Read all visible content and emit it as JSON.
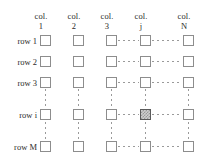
{
  "figure": {
    "colors": {
      "background": "#ffffff",
      "text": "#2b2b2b",
      "cell_border": "#8d8d8d",
      "cell_fill": "#ffffff",
      "highlight_border": "#5a5a5a",
      "highlight_fill": "#cfcfcf",
      "highlight_hatch": "#9a9a9a",
      "dot_color": "#9a9a9a"
    }
  },
  "columns": [
    {
      "word": "col.",
      "index": "1",
      "x": 40
    },
    {
      "word": "col.",
      "index": "2",
      "x": 73
    },
    {
      "word": "col.",
      "index": "3",
      "x": 106
    },
    {
      "word": "col.",
      "index": "j",
      "x": 140
    },
    {
      "word": "col.",
      "index": "N",
      "x": 183
    }
  ],
  "rows": [
    {
      "label": "row 1",
      "y": 35
    },
    {
      "label": "row 2",
      "y": 56
    },
    {
      "label": "row 3",
      "y": 77
    },
    {
      "label": "row i",
      "y": 109
    },
    {
      "label": "row M",
      "y": 141
    }
  ],
  "highlighted_cell": {
    "row": "row i",
    "column": "col. j",
    "row_index": 3,
    "column_index": 3,
    "fill": "hatched-gray"
  },
  "ellipsis": {
    "horizontal_between": [
      {
        "from": "col. 3",
        "to": "col. j"
      },
      {
        "from": "col. j",
        "to": "col. N"
      }
    ],
    "vertical_between": [
      {
        "from": "row 3",
        "to": "row i"
      },
      {
        "from": "row i",
        "to": "row M"
      }
    ]
  }
}
